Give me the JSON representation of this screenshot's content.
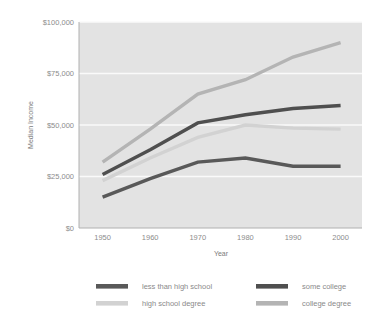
{
  "chart_data": {
    "type": "line",
    "title": "",
    "xlabel": "Year",
    "ylabel": "Median Income",
    "x": [
      1950,
      1960,
      1970,
      1980,
      1990,
      2000
    ],
    "xtick_labels": [
      "1950",
      "1960",
      "1970",
      "1980",
      "1990",
      "2000"
    ],
    "ytick_labels": [
      "$0",
      "$25,000",
      "$50,000",
      "$75,000",
      "$100,000"
    ],
    "ytick_values": [
      0,
      25000,
      50000,
      75000,
      100000
    ],
    "ylim": [
      0,
      100000
    ],
    "xlim": [
      1950,
      2000
    ],
    "grid": "horizontal",
    "legend_position": "bottom",
    "plot_background": "#e3e3e3",
    "series": [
      {
        "name": "less than high school",
        "color": "#595959",
        "values": [
          15000,
          24000,
          32000,
          34000,
          30000,
          30000
        ]
      },
      {
        "name": "high school degree",
        "color": "#d2d2d2",
        "values": [
          23000,
          34000,
          44000,
          50000,
          48500,
          48000
        ]
      },
      {
        "name": "some college",
        "color": "#4f4f4f",
        "values": [
          26000,
          38000,
          51000,
          55000,
          58000,
          59500
        ]
      },
      {
        "name": "college degree",
        "color": "#b4b4b4",
        "values": [
          32000,
          48000,
          65000,
          72000,
          83000,
          90000
        ]
      }
    ]
  },
  "legend": {
    "entries": [
      {
        "label": "less than high school",
        "color": "#595959"
      },
      {
        "label": "some college",
        "color": "#4f4f4f"
      },
      {
        "label": "high school degree",
        "color": "#d2d2d2"
      },
      {
        "label": "college degree",
        "color": "#b4b4b4"
      }
    ]
  },
  "axes": {
    "y_title": "Median Income",
    "x_title": "Year"
  }
}
